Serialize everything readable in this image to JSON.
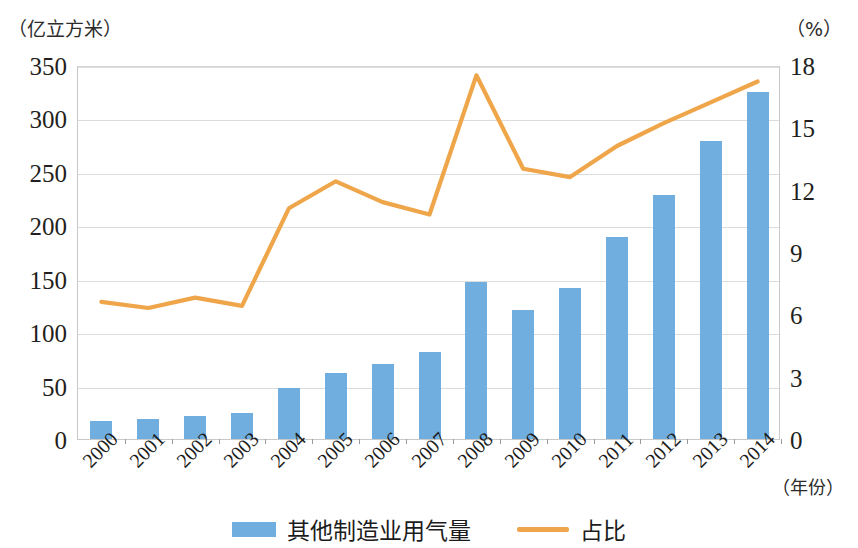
{
  "axes": {
    "left_unit": "（亿立方米）",
    "right_unit": "（%）",
    "x_unit": "（年份）"
  },
  "legend": {
    "bar_label": "其他制造业用气量",
    "line_label": "占比",
    "bar_color": "#6FAEDE",
    "line_color": "#EFA64A"
  },
  "chart_data": {
    "type": "bar",
    "title": "",
    "xlabel": "（年份）",
    "ylabel": "（亿立方米）",
    "y2label": "（%）",
    "ylim": [
      0,
      350
    ],
    "y2lim": [
      0,
      18
    ],
    "yticks": [
      0,
      50,
      100,
      150,
      200,
      250,
      300,
      350
    ],
    "y2ticks": [
      0,
      3,
      6,
      9,
      12,
      15,
      18
    ],
    "grid": true,
    "legend_position": "bottom",
    "categories": [
      "2000",
      "2001",
      "2002",
      "2003",
      "2004",
      "2005",
      "2006",
      "2007",
      "2008",
      "2009",
      "2010",
      "2011",
      "2012",
      "2013",
      "2014"
    ],
    "series": [
      {
        "name": "其他制造业用气量",
        "type": "bar",
        "axis": "left",
        "unit": "亿立方米",
        "color": "#6FAEDE",
        "values": [
          17,
          19,
          22,
          24,
          48,
          62,
          70,
          81,
          147,
          121,
          141,
          189,
          228,
          279,
          325
        ]
      },
      {
        "name": "占比",
        "type": "line",
        "axis": "right",
        "unit": "%",
        "color": "#EFA64A",
        "values": [
          6.7,
          6.4,
          6.9,
          6.5,
          11.2,
          12.5,
          11.5,
          10.9,
          17.6,
          13.1,
          12.7,
          14.2,
          15.3,
          16.3,
          17.3
        ]
      }
    ]
  }
}
